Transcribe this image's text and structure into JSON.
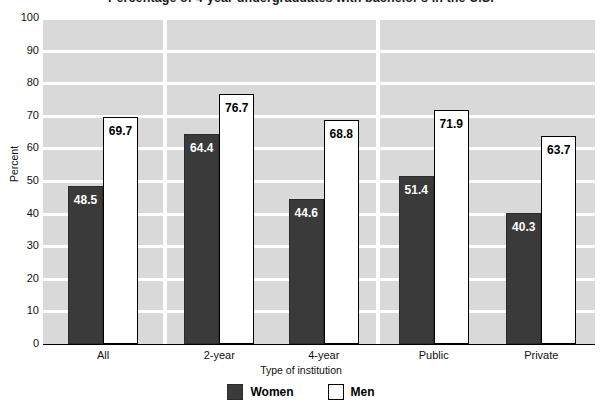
{
  "chart_data": {
    "type": "bar",
    "title": "Percentage of 4-year undergraduates with bachelor's in the U.S.",
    "xlabel": "Type of institution",
    "ylabel": "Percent",
    "ylim": [
      0,
      100
    ],
    "ytick_step": 10,
    "ytick_labels": [
      "0",
      "10",
      "20",
      "30",
      "40",
      "50",
      "60",
      "70",
      "80",
      "90",
      "100"
    ],
    "grid": true,
    "legend_position": "bottom",
    "categories": [
      "All",
      "2-year",
      "4-year",
      "Public",
      "Private"
    ],
    "panels": [
      {
        "name": "overall",
        "categories": [
          "All"
        ]
      },
      {
        "name": "level",
        "categories": [
          "2-year",
          "4-year"
        ]
      },
      {
        "name": "control",
        "categories": [
          "Public",
          "Private"
        ]
      }
    ],
    "series": [
      {
        "name": "Women",
        "color": "#3a3a3a",
        "values": [
          48.5,
          64.4,
          44.6,
          51.4,
          40.3
        ],
        "labels": [
          "48.5",
          "64.4",
          "44.6",
          "51.4",
          "40.3"
        ]
      },
      {
        "name": "Men",
        "color": "#ffffff",
        "values": [
          69.7,
          76.7,
          68.8,
          71.9,
          63.7
        ],
        "labels": [
          "69.7",
          "76.7",
          "68.8",
          "71.9",
          "63.7"
        ]
      }
    ]
  },
  "legend": {
    "items": [
      {
        "label": "Women",
        "swatch": "women"
      },
      {
        "label": "Men",
        "swatch": "men"
      }
    ]
  }
}
